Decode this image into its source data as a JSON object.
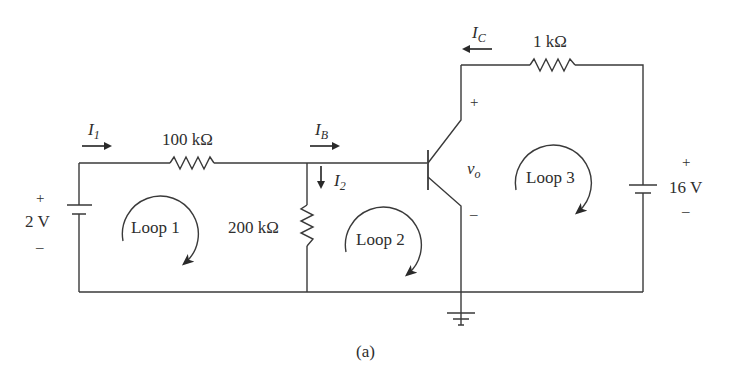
{
  "diagram": {
    "caption": "(a)",
    "components": {
      "source_left": {
        "value": "2 V",
        "plus": "+",
        "minus": "–"
      },
      "source_right": {
        "value": "16 V",
        "plus": "+",
        "minus": "–"
      },
      "r1": {
        "value": "100 kΩ"
      },
      "r2": {
        "value": "200 kΩ"
      },
      "r3": {
        "value": "1 kΩ"
      },
      "transistor": {
        "type": "npn-bjt",
        "vo_label": "v",
        "vo_sub": "o",
        "plus": "+",
        "minus": "–"
      }
    },
    "currents": [
      {
        "id": "I1",
        "main": "I",
        "sub": "1",
        "direction": "right"
      },
      {
        "id": "IB",
        "main": "I",
        "sub": "B",
        "direction": "right"
      },
      {
        "id": "I2",
        "main": "I",
        "sub": "2",
        "direction": "down"
      },
      {
        "id": "IC",
        "main": "I",
        "sub": "C",
        "direction": "left"
      }
    ],
    "loops": [
      {
        "label": "Loop 1",
        "direction": "clockwise"
      },
      {
        "label": "Loop 2",
        "direction": "clockwise"
      },
      {
        "label": "Loop 3",
        "direction": "clockwise"
      }
    ],
    "colors": {
      "line": "#3a3a3a",
      "background": "#ffffff"
    }
  }
}
